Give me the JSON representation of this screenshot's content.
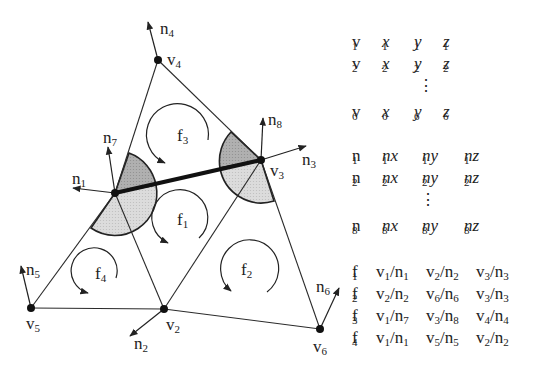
{
  "diagram": {
    "vertices": [
      {
        "id": "v1",
        "label": "v",
        "sub": "1",
        "x": 115,
        "y": 193
      },
      {
        "id": "v2",
        "label": "v",
        "sub": "2",
        "x": 164,
        "y": 309
      },
      {
        "id": "v3",
        "label": "v",
        "sub": "3",
        "x": 261,
        "y": 160
      },
      {
        "id": "v4",
        "label": "v",
        "sub": "4",
        "x": 158,
        "y": 60
      },
      {
        "id": "v5",
        "label": "v",
        "sub": "5",
        "x": 31,
        "y": 308
      },
      {
        "id": "v6",
        "label": "v",
        "sub": "6",
        "x": 320,
        "y": 329
      }
    ],
    "normals": [
      {
        "id": "n1",
        "label": "n",
        "sub": "1",
        "from": "v1"
      },
      {
        "id": "n2",
        "label": "n",
        "sub": "2",
        "from": "v2"
      },
      {
        "id": "n3",
        "label": "n",
        "sub": "3",
        "from": "v3"
      },
      {
        "id": "n4",
        "label": "n",
        "sub": "4",
        "from": "v4"
      },
      {
        "id": "n5",
        "label": "n",
        "sub": "5",
        "from": "v5"
      },
      {
        "id": "n6",
        "label": "n",
        "sub": "6",
        "from": "v6"
      },
      {
        "id": "n7",
        "label": "n",
        "sub": "7",
        "from": "v1"
      },
      {
        "id": "n8",
        "label": "n",
        "sub": "8",
        "from": "v3"
      }
    ],
    "faces": [
      {
        "id": "f1",
        "label": "f",
        "sub": "1"
      },
      {
        "id": "f2",
        "label": "f",
        "sub": "2"
      },
      {
        "id": "f3",
        "label": "f",
        "sub": "3"
      },
      {
        "id": "f4",
        "label": "f",
        "sub": "4"
      }
    ],
    "crease_edge": [
      "v1",
      "v3"
    ],
    "colors": {
      "line": "#222222",
      "dark_fill": "#a9a9a9",
      "light_fill": "#d6d6d6"
    }
  },
  "vertex_table": {
    "rows": [
      {
        "name": "v",
        "i": "1",
        "c": [
          "x",
          "y",
          "z"
        ]
      },
      {
        "name": "v",
        "i": "2",
        "c": [
          "x",
          "y",
          "z"
        ]
      },
      {
        "name": "v",
        "i": "6",
        "c": [
          "x",
          "y",
          "z"
        ]
      }
    ],
    "ellipsis": "⋮"
  },
  "normal_table": {
    "rows": [
      {
        "name": "n",
        "i": "1",
        "c": [
          "nx",
          "ny",
          "nz"
        ]
      },
      {
        "name": "n",
        "i": "2",
        "c": [
          "nx",
          "ny",
          "nz"
        ]
      },
      {
        "name": "n",
        "i": "8",
        "c": [
          "nx",
          "ny",
          "nz"
        ]
      }
    ],
    "ellipsis": "⋮"
  },
  "face_table": {
    "rows": [
      {
        "face": "f",
        "fi": "1",
        "refs": [
          [
            "1",
            "1"
          ],
          [
            "2",
            "2"
          ],
          [
            "3",
            "3"
          ]
        ]
      },
      {
        "face": "f",
        "fi": "2",
        "refs": [
          [
            "2",
            "2"
          ],
          [
            "6",
            "6"
          ],
          [
            "3",
            "3"
          ]
        ]
      },
      {
        "face": "f",
        "fi": "3",
        "refs": [
          [
            "1",
            "7"
          ],
          [
            "3",
            "8"
          ],
          [
            "4",
            "4"
          ]
        ]
      },
      {
        "face": "f",
        "fi": "4",
        "refs": [
          [
            "1",
            "1"
          ],
          [
            "5",
            "5"
          ],
          [
            "2",
            "2"
          ]
        ]
      }
    ]
  }
}
